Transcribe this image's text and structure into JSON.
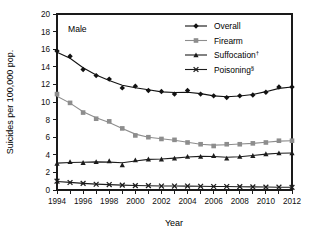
{
  "chart_data": {
    "type": "line",
    "title": "",
    "panel_label": "Male",
    "xlabel": "Year",
    "ylabel": "Suicides per 100,000 pop.",
    "x": [
      1994,
      1995,
      1996,
      1997,
      1998,
      1999,
      2000,
      2001,
      2002,
      2003,
      2004,
      2005,
      2006,
      2007,
      2008,
      2009,
      2010,
      2011,
      2012
    ],
    "xlim": [
      1994,
      2012
    ],
    "ylim": [
      0,
      20
    ],
    "xticks": [
      1994,
      1995,
      1996,
      1997,
      1998,
      1999,
      2000,
      2001,
      2002,
      2003,
      2004,
      2005,
      2006,
      2007,
      2008,
      2009,
      2010,
      2011,
      2012
    ],
    "xtick_labels": [
      "1994",
      "",
      "1996",
      "",
      "1998",
      "",
      "2000",
      "",
      "2002",
      "",
      "2004",
      "",
      "2006",
      "",
      "2008",
      "",
      "2010",
      "",
      "2012"
    ],
    "yticks": [
      0,
      2,
      4,
      6,
      8,
      10,
      12,
      14,
      16,
      18,
      20
    ],
    "ytick_labels": [
      "0",
      "2",
      "4",
      "6",
      "8",
      "10",
      "12",
      "14",
      "16",
      "18",
      "20"
    ],
    "grid": false,
    "legend_position": "top-right",
    "series": [
      {
        "name": "Overall",
        "label": "Overall",
        "marker": "diamond",
        "color": "#121212",
        "values": [
          15.8,
          15.2,
          13.7,
          13.0,
          12.6,
          11.6,
          11.8,
          11.3,
          11.2,
          10.9,
          11.3,
          10.9,
          10.7,
          10.5,
          10.7,
          10.8,
          11.1,
          11.7,
          11.7
        ]
      },
      {
        "name": "Firearm",
        "label": "Firearm",
        "marker": "square",
        "color": "#8d8d8d",
        "values": [
          10.9,
          9.9,
          8.8,
          8.1,
          7.8,
          7.0,
          6.2,
          6.0,
          5.8,
          5.7,
          5.4,
          5.2,
          5.0,
          5.2,
          5.2,
          5.3,
          5.4,
          5.6,
          5.6
        ]
      },
      {
        "name": "Suffocation",
        "label": "Suffocation",
        "superscript": "†",
        "marker": "triangle",
        "color": "#1c1c1c",
        "values": [
          3.0,
          3.2,
          3.1,
          3.2,
          3.3,
          2.85,
          3.4,
          3.5,
          3.5,
          3.6,
          3.8,
          3.8,
          3.9,
          3.6,
          3.8,
          3.9,
          4.1,
          4.2,
          4.2
        ]
      },
      {
        "name": "Poisoning",
        "label": "Poisoning",
        "superscript": "§",
        "marker": "x",
        "color": "#1c1c1c",
        "values": [
          1.0,
          0.85,
          0.75,
          0.65,
          0.62,
          0.55,
          0.5,
          0.5,
          0.45,
          0.45,
          0.45,
          0.42,
          0.4,
          0.4,
          0.38,
          0.35,
          0.33,
          0.32,
          0.3
        ]
      }
    ]
  },
  "legend": {
    "items": [
      {
        "label": "Overall",
        "sup": ""
      },
      {
        "label": "Firearm",
        "sup": ""
      },
      {
        "label": "Suffocation",
        "sup": "†"
      },
      {
        "label": "Poisoning",
        "sup": "§"
      }
    ]
  },
  "colors": {
    "overall": "#121212",
    "firearm": "#8d8d8d",
    "suffocation": "#1c1c1c",
    "poisoning": "#1c1c1c",
    "axis": "#1a1a1a",
    "background": "#ffffff"
  }
}
